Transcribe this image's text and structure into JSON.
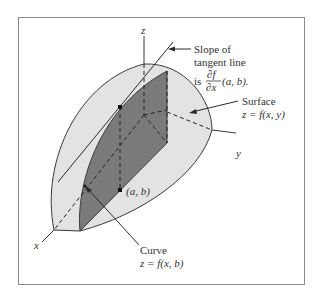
{
  "figure": {
    "colors": {
      "frame": "#8a8a8a",
      "surface_fill": "#e3e3e3",
      "slice_fill": "#7a7a7a",
      "outline": "#3a3a3a",
      "text": "#333333",
      "background": "#ffffff"
    },
    "axes": {
      "x_label": "x",
      "y_label": "y",
      "z_label": "z"
    },
    "annotations": {
      "tangent": {
        "line1": "Slope of",
        "line2": "tangent line",
        "line3_prefix": "is",
        "fraction_numerator": "∂f",
        "fraction_denominator": "∂x",
        "line3_suffix": "(a, b)."
      },
      "surface": {
        "line1": "Surface",
        "line2": "z = f(x, y)"
      },
      "point": {
        "label": "(a, b)"
      },
      "curve": {
        "line1": "Curve",
        "line2": "z = f(x, b)"
      }
    }
  }
}
